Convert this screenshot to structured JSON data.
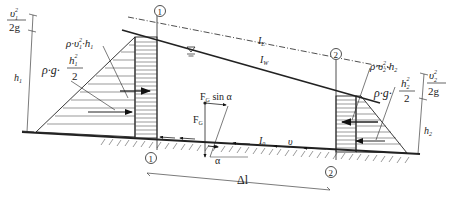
{
  "diagram": {
    "type": "hydraulics-open-channel-momentum",
    "sections": [
      {
        "id": "section-1",
        "label": "1"
      },
      {
        "id": "section-2",
        "label": "2"
      }
    ],
    "lines": {
      "energy_line": {
        "label": "I",
        "sub": "E"
      },
      "water_surface": {
        "label": "I",
        "sub": "W"
      },
      "bed_slope": {
        "label": "I",
        "sub": "0"
      }
    },
    "velocity_label": "υ",
    "left": {
      "velocity_head": {
        "num": "υ",
        "num_sub": "1",
        "num_sup": "2",
        "den": "2g"
      },
      "depth": {
        "label": "h",
        "sub": "1"
      },
      "dynamic_force": {
        "text": "ρ·υ",
        "sub": "1",
        "sup": "2",
        "tail": "·h",
        "tail_sub": "1"
      },
      "hydrostatic_force": {
        "prefix": "ρ·g·",
        "num": "h",
        "num_sub": "1",
        "num_sup": "2",
        "den": "2"
      }
    },
    "right": {
      "velocity_head": {
        "num": "υ",
        "num_sub": "2",
        "num_sup": "2",
        "den": "2g"
      },
      "depth": {
        "label": "h",
        "sub": "2"
      },
      "dynamic_force": {
        "text": "ρ·υ",
        "sub": "2",
        "sup": "2",
        "tail": "·h",
        "tail_sub": "2"
      },
      "hydrostatic_force": {
        "prefix": "ρ·g·",
        "num": "h",
        "num_sub": "2",
        "num_sup": "2",
        "den": "2"
      }
    },
    "gravity": {
      "weight": {
        "label": "F",
        "sub": "G"
      },
      "component": {
        "label": "F",
        "sub": "G",
        "tail": " sin α"
      },
      "angle": "α"
    },
    "length_label": "Δl"
  }
}
